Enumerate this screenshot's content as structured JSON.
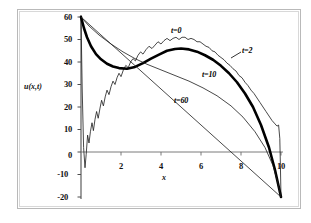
{
  "chart_data": {
    "type": "line",
    "title": "",
    "xlabel": "x",
    "ylabel": "u(x,t)",
    "xlim": [
      0,
      10
    ],
    "ylim": [
      -20,
      60
    ],
    "xticks": [
      2,
      4,
      6,
      8,
      10
    ],
    "yticks": [
      60,
      50,
      40,
      30,
      20,
      10,
      0,
      -10,
      -20
    ],
    "xtick_labels": [
      "2",
      "4",
      "6",
      "8",
      "10"
    ],
    "ytick_labels": [
      "60",
      "50",
      "40",
      "30",
      "20",
      "10",
      "0",
      "-10",
      "-20"
    ],
    "grid": false,
    "legend": "inline-annotations",
    "annotations": [
      {
        "text": "t=0",
        "x": 4.85,
        "y": 55.5
      },
      {
        "text": "t=2",
        "x": 8.35,
        "y": 46.5
      },
      {
        "text": "t=10",
        "x": 6.25,
        "y": 35.5
      },
      {
        "text": "t=60",
        "x": 5.15,
        "y": 24.0
      }
    ],
    "series": [
      {
        "name": "t=0",
        "label": "t=0",
        "color": "#1a1a1a",
        "width": 0.8,
        "description": "Truncated Fourier series partial sum with Gibbs oscillations; starts at 60, plunges to about -7 near x=0.25, rises with ringing to a rippled plateau peaking near 51 around x=5.2, then descends with ripples to -20 at x=10",
        "x": [
          0.0,
          0.06,
          0.13,
          0.2,
          0.26,
          0.33,
          0.4,
          0.47,
          0.55,
          0.62,
          0.7,
          0.78,
          0.86,
          0.95,
          1.03,
          1.12,
          1.21,
          1.3,
          1.4,
          1.5,
          1.6,
          1.7,
          1.8,
          1.9,
          2.0,
          2.12,
          2.24,
          2.36,
          2.48,
          2.6,
          2.72,
          2.85,
          2.98,
          3.1,
          3.25,
          3.4,
          3.55,
          3.7,
          3.85,
          4.0,
          4.15,
          4.3,
          4.45,
          4.6,
          4.75,
          4.9,
          5.05,
          5.2,
          5.35,
          5.5,
          5.65,
          5.8,
          5.95,
          6.1,
          6.25,
          6.4,
          6.55,
          6.7,
          6.85,
          7.0,
          7.15,
          7.3,
          7.45,
          7.6,
          7.75,
          7.9,
          8.05,
          8.2,
          8.35,
          8.5,
          8.65,
          8.8,
          8.95,
          9.1,
          9.25,
          9.4,
          9.55,
          9.7,
          9.8,
          9.88,
          9.94,
          9.97,
          10.0
        ],
        "y": [
          60.0,
          28.0,
          2.0,
          -7.0,
          -1.0,
          7.5,
          4.0,
          9.0,
          13.0,
          9.5,
          14.5,
          18.0,
          15.0,
          19.5,
          23.0,
          20.5,
          24.5,
          27.5,
          25.5,
          29.0,
          31.5,
          30.0,
          33.0,
          35.0,
          33.5,
          36.5,
          38.5,
          37.5,
          40.0,
          41.5,
          40.5,
          43.0,
          44.5,
          43.5,
          45.5,
          47.0,
          46.0,
          47.5,
          49.0,
          48.0,
          49.5,
          50.5,
          49.5,
          50.5,
          51.0,
          50.0,
          51.0,
          51.0,
          50.0,
          50.5,
          50.0,
          49.0,
          49.0,
          48.0,
          47.0,
          46.5,
          45.0,
          44.5,
          43.0,
          42.0,
          41.0,
          39.5,
          38.5,
          37.0,
          36.0,
          34.0,
          33.0,
          31.0,
          29.5,
          27.5,
          26.0,
          24.0,
          22.0,
          20.0,
          18.0,
          16.0,
          14.0,
          12.5,
          11.5,
          12.0,
          6.0,
          -6.0,
          -20.0
        ]
      },
      {
        "name": "t=2",
        "label": "t=2",
        "color": "#000000",
        "width": 2.6,
        "description": "Smoothed solution at t=2; from 60 it drops to a local minimum near 37 at x=2.3, rises to a broad maximum of about 46 at x=5.0, then falls steeply to -20 at x=10",
        "x": [
          0.0,
          0.15,
          0.3,
          0.5,
          0.75,
          1.0,
          1.3,
          1.6,
          1.9,
          2.3,
          2.7,
          3.1,
          3.5,
          3.9,
          4.3,
          4.7,
          5.0,
          5.4,
          5.8,
          6.2,
          6.6,
          7.0,
          7.4,
          7.8,
          8.2,
          8.6,
          9.0,
          9.4,
          9.7,
          9.9,
          10.0
        ],
        "y": [
          60.0,
          55.0,
          51.0,
          47.0,
          43.5,
          41.2,
          39.2,
          38.0,
          37.3,
          37.0,
          37.8,
          39.5,
          41.5,
          43.3,
          45.0,
          45.8,
          46.0,
          45.6,
          44.6,
          43.0,
          41.0,
          38.3,
          35.0,
          31.0,
          26.0,
          20.0,
          12.0,
          2.0,
          -8.0,
          -16.0,
          -20.0
        ]
      },
      {
        "name": "t=10",
        "label": "t=10",
        "color": "#1a1a1a",
        "width": 0.8,
        "description": "Solution at t=10; a smooth concave arc from 60 that decays monotonically to -20 at x=10",
        "x": [
          0.0,
          0.4,
          0.9,
          1.5,
          2.1,
          2.7,
          3.3,
          4.0,
          4.7,
          5.4,
          6.1,
          6.8,
          7.5,
          8.1,
          8.7,
          9.2,
          9.6,
          9.85,
          10.0
        ],
        "y": [
          60.0,
          56.0,
          52.0,
          48.0,
          44.5,
          41.5,
          39.0,
          36.5,
          34.0,
          31.5,
          28.5,
          25.0,
          20.5,
          15.5,
          9.0,
          2.0,
          -6.0,
          -14.0,
          -20.0
        ]
      },
      {
        "name": "t=60",
        "label": "t=60",
        "color": "#1a1a1a",
        "width": 0.8,
        "description": "Steady-state line at t=60; a straight line from (0,60) down to (10,-20)",
        "x": [
          0.0,
          10.0
        ],
        "y": [
          60.0,
          -20.0
        ]
      }
    ]
  }
}
